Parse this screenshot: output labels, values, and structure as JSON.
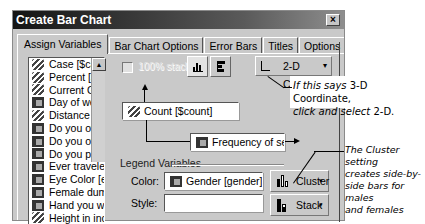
{
  "window": {
    "title": "Create Bar Chart",
    "close_glyph": "×"
  },
  "tabs": [
    {
      "label": "Assign Variables",
      "active": true
    },
    {
      "label": "Bar Chart Options",
      "active": false
    },
    {
      "label": "Error Bars",
      "active": false
    },
    {
      "label": "Titles",
      "active": false
    },
    {
      "label": "Options",
      "active": false
    }
  ],
  "variable_list": {
    "items": [
      {
        "label": "Case [$case",
        "icon": "scale"
      },
      {
        "label": "Percent [$pc",
        "icon": "scale"
      },
      {
        "label": "Current GPA",
        "icon": "scale"
      },
      {
        "label": "Day of week",
        "icon": "nominal"
      },
      {
        "label": "Distance bet",
        "icon": "scale"
      },
      {
        "label": "Do you own",
        "icon": "nominal"
      },
      {
        "label": "Do you own",
        "icon": "nominal"
      },
      {
        "label": "Do you persc",
        "icon": "nominal"
      },
      {
        "label": "Ever travelec",
        "icon": "nominal"
      },
      {
        "label": "Eye Color [ey",
        "icon": "nominal"
      },
      {
        "label": "Female dumr",
        "icon": "nominal"
      },
      {
        "label": "Hand you wr",
        "icon": "nominal"
      },
      {
        "label": "Height in incl",
        "icon": "scale"
      }
    ],
    "scroll_up_glyph": "▲"
  },
  "options": {
    "percent_stacked_label": "100% stacked",
    "percent_stacked_checked": false
  },
  "coordinate": {
    "label": "2-D Coordinate",
    "caret": "▾"
  },
  "axes": {
    "y_variable": "Count [$count]",
    "x_variable": "Frequency of seat be"
  },
  "legend": {
    "heading": "Legend Variables",
    "color_label": "Color:",
    "color_value": "Gender [gender]",
    "style_label": "Style:",
    "style_value": "",
    "cluster_label": "Cluster",
    "stack_label": "Stack",
    "caret": "▾"
  },
  "annotations": {
    "coordinate_note_pre": "If this says ",
    "coordinate_note_3d": "3-D Coordinate,",
    "coordinate_note_mid": "click and select ",
    "coordinate_note_2d": "2-D.",
    "cluster_note": [
      "The Cluster setting",
      "creates side-by-",
      "side bars for males",
      "and females"
    ]
  }
}
